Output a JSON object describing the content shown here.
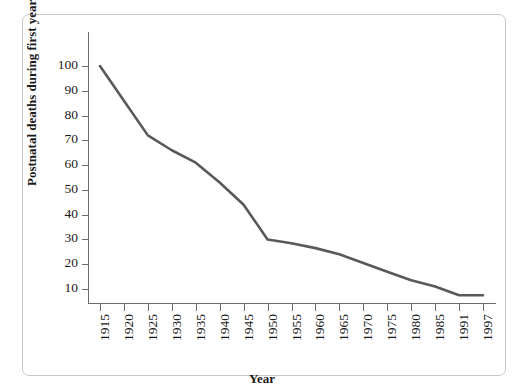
{
  "chart_data": {
    "type": "line",
    "title": "",
    "subtitle": "",
    "xlabel": "Year",
    "ylabel": "Postnatal deaths during first year per 1000 live births",
    "x_tick_labels": [
      "1915",
      "1920",
      "1925",
      "1930",
      "1935",
      "1940",
      "1945",
      "1950",
      "1955",
      "1960",
      "1965",
      "1970",
      "1975",
      "1980",
      "1985",
      "1991",
      "1997"
    ],
    "y_tick_labels": [
      "10",
      "20",
      "30",
      "40",
      "50",
      "60",
      "70",
      "80",
      "90",
      "100"
    ],
    "y_ticks": [
      10,
      20,
      30,
      40,
      50,
      60,
      70,
      80,
      90,
      100
    ],
    "ylim": [
      0,
      108
    ],
    "xlim": [
      "1915",
      "1997"
    ],
    "grid": false,
    "legend": null,
    "legend_position": "none",
    "series": [
      {
        "name": "Postnatal deaths per 1000 live births",
        "color": "#595959",
        "categories": [
          "1915",
          "1920",
          "1925",
          "1930",
          "1935",
          "1940",
          "1945",
          "1950",
          "1955",
          "1960",
          "1965",
          "1970",
          "1975",
          "1980",
          "1985",
          "1991",
          "1997"
        ],
        "values": [
          100,
          86,
          72,
          66,
          61,
          53,
          44,
          30,
          28.5,
          26.5,
          24,
          20.5,
          17,
          13.5,
          11,
          7.5,
          7.5
        ]
      }
    ],
    "annotations": []
  },
  "axes": {
    "x_axis_name": "Year",
    "y_axis_name": "Postnatal deaths during first year per 1000 live births"
  },
  "style": {
    "line_color": "#595959",
    "axis_color": "#6b6b6b",
    "frame_color": "#c8c8c8",
    "text_color": "#1a1a1a",
    "background": "#ffffff"
  }
}
